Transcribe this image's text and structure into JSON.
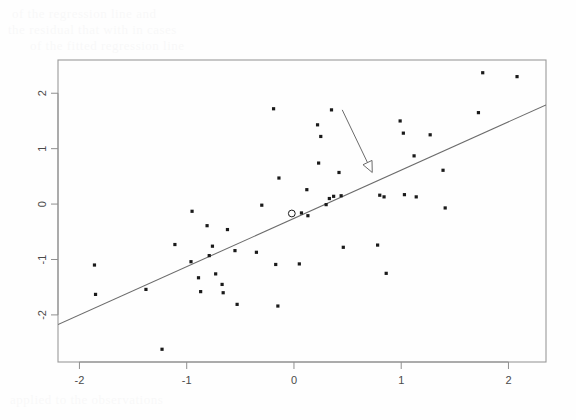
{
  "figure": {
    "background_color": "#fefefe",
    "plot_frame": {
      "left": 58,
      "top": 60,
      "right": 546,
      "bottom": 362
    },
    "frame_color": "#9a9a9a",
    "axis_color": "#8f8f8f",
    "point_color": "#1a1a1a",
    "line_color": "#6b6b6b"
  },
  "chart_data": {
    "type": "scatter",
    "title": "",
    "xlabel": "",
    "ylabel": "",
    "xlim": [
      -2.2,
      2.35
    ],
    "ylim": [
      -2.85,
      2.6
    ],
    "grid": false,
    "legend": null,
    "xticks": [
      -2,
      -1,
      0,
      1,
      2
    ],
    "xticklabels": [
      "-2",
      "-1",
      "0",
      "1",
      "2"
    ],
    "yticks": [
      2,
      1,
      0,
      -1,
      -2
    ],
    "yticklabels": [
      "2",
      "1",
      "0",
      "-1",
      "-2"
    ],
    "ytick_rotation": 90,
    "series": [
      {
        "name": "observations",
        "marker": "filled-square-dot",
        "x": [
          -1.86,
          -1.85,
          -1.38,
          -1.23,
          -1.11,
          -0.96,
          -0.95,
          -0.89,
          -0.87,
          -0.81,
          -0.79,
          -0.76,
          -0.73,
          -0.67,
          -0.66,
          -0.62,
          -0.55,
          -0.53,
          -0.35,
          -0.3,
          -0.19,
          -0.17,
          -0.15,
          -0.14,
          0.05,
          0.07,
          0.12,
          0.13,
          0.22,
          0.23,
          0.25,
          0.3,
          0.33,
          0.35,
          0.37,
          0.42,
          0.44,
          0.46,
          0.78,
          0.8,
          0.84,
          0.86,
          0.99,
          1.02,
          1.03,
          1.12,
          1.14,
          1.27,
          1.39,
          1.41,
          1.72,
          1.76,
          2.08
        ],
        "y": [
          -1.1,
          -1.63,
          -1.54,
          -2.62,
          -0.73,
          -1.04,
          -0.13,
          -1.33,
          -1.58,
          -0.39,
          -0.93,
          -0.76,
          -1.26,
          -1.45,
          -1.6,
          -0.46,
          -0.84,
          -1.81,
          -0.87,
          -0.02,
          1.72,
          -1.09,
          -1.84,
          0.47,
          -1.08,
          -0.16,
          0.26,
          -0.21,
          1.43,
          0.74,
          1.22,
          -0.01,
          0.1,
          1.7,
          0.14,
          0.57,
          0.15,
          -0.78,
          -0.74,
          0.16,
          0.13,
          -1.25,
          1.5,
          1.28,
          0.17,
          0.87,
          0.13,
          1.25,
          0.61,
          -0.07,
          1.65,
          2.37,
          2.3
        ]
      },
      {
        "name": "highlighted-point",
        "marker": "open-circle",
        "x": [
          -0.02
        ],
        "y": [
          -0.17
        ]
      }
    ],
    "regression_line": {
      "name": "fitted-line",
      "slope": 0.872,
      "intercept": -0.258,
      "x_start": -2.2,
      "x_end": 2.35,
      "y_start": -2.175,
      "y_end": 1.79
    },
    "annotations": [
      {
        "type": "arrow",
        "name": "pointer-arrow",
        "tail_x": 0.45,
        "tail_y": 1.7,
        "head_x": 0.73,
        "head_y": 0.57,
        "head_style": "open",
        "color": "#6b6b6b"
      }
    ]
  },
  "scan_artifacts": {
    "top_text_line_1": "of the regression line and",
    "top_text_line_2": "the residual that with in cases",
    "top_text_line_3": "of the fitted regression line",
    "bottom_text_line_1": "applied to the observations"
  }
}
